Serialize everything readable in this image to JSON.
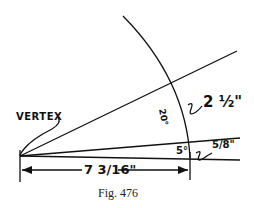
{
  "figure": {
    "caption": "Fig. 476",
    "labels": {
      "vertex": "VERTEX",
      "angle_large": "20°",
      "angle_small": "5°",
      "length_large": "2 ½\"",
      "length_small": "5/8\"",
      "base_length": "7 3/16\""
    }
  }
}
